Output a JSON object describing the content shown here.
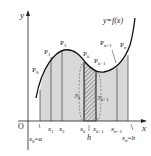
{
  "diagram": {
    "type": "riemann-trapezoid-area",
    "axes": {
      "x_label": "x",
      "y_label": "y",
      "origin_label": "O"
    },
    "curve_label": "y=f(x)",
    "points": [
      "P0",
      "P1",
      "P2",
      "Pk",
      "Pk+1",
      "Pn-1",
      "Pn"
    ],
    "x_ticks": [
      "x1",
      "x2",
      "xk",
      "xk+1",
      "xn-1"
    ],
    "endpoints": {
      "left": "x0=a",
      "right": "xn=b"
    },
    "ordinates": [
      "yk",
      "yk+1"
    ],
    "width_label": "h",
    "colors": {
      "fill": "#d9d9d9",
      "stroke": "#222222",
      "hatch": "#555555"
    }
  }
}
